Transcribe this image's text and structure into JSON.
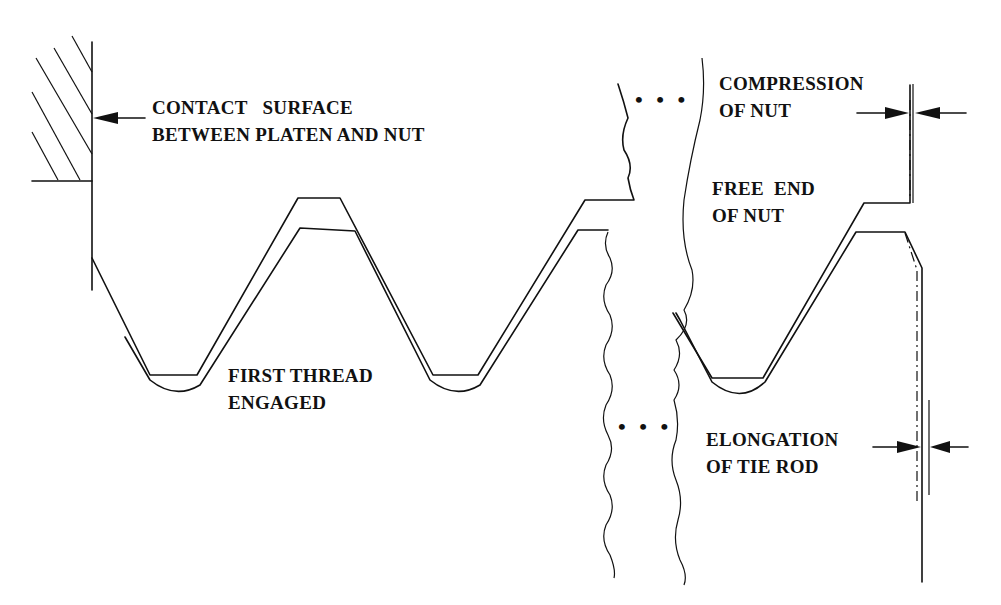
{
  "diagram": {
    "labels": {
      "contact_surface": [
        "CONTACT   SURFACE",
        "BETWEEN PLATEN AND NUT"
      ],
      "first_thread": [
        "FIRST THREAD",
        "ENGAGED"
      ],
      "compression": [
        "COMPRESSION",
        "OF NUT"
      ],
      "free_end": [
        "FREE  END",
        "OF NUT"
      ],
      "elongation": [
        "ELONGATION",
        "OF TIE ROD"
      ]
    },
    "ellipsis_top": "• • •",
    "ellipsis_bottom": "• • •",
    "colors": {
      "line": "#111111",
      "background": "#ffffff"
    }
  }
}
